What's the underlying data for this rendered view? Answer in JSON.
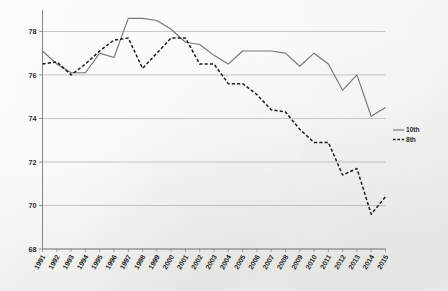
{
  "chart_data": {
    "type": "line",
    "title": "",
    "subtitle": "",
    "xlabel": "",
    "ylabel": "",
    "grid": "horizontal",
    "legend_position": "right-middle",
    "xlim": [
      1991,
      2015
    ],
    "ylim": [
      68,
      78.8
    ],
    "yticks": [
      68,
      70,
      72,
      74,
      76,
      78
    ],
    "ytick_labels": [
      "68",
      "70",
      "72",
      "74",
      "76",
      "78"
    ],
    "categories": [
      "1991",
      "1992",
      "1993",
      "1994",
      "1995",
      "1996",
      "1997",
      "1998",
      "1999",
      "2000",
      "2001",
      "2002",
      "2003",
      "2004",
      "2005",
      "2006",
      "2007",
      "2008",
      "2009",
      "2010",
      "2011",
      "2012",
      "2013",
      "2014",
      "2015"
    ],
    "series": [
      {
        "name": "10th",
        "style": "solid",
        "color": "#767676",
        "values": [
          77.1,
          76.5,
          76.1,
          76.1,
          77.0,
          76.8,
          78.6,
          78.6,
          78.5,
          78.1,
          77.5,
          77.4,
          76.9,
          76.5,
          77.1,
          77.1,
          77.1,
          77.0,
          76.4,
          77.0,
          76.5,
          75.3,
          76.0,
          74.1,
          74.5
        ]
      },
      {
        "name": "8th",
        "style": "dashed",
        "color": "#1c1c1c",
        "values": [
          76.5,
          76.6,
          76.0,
          76.5,
          77.1,
          77.6,
          77.7,
          76.3,
          77.0,
          77.7,
          77.7,
          76.5,
          76.5,
          75.6,
          75.6,
          75.1,
          74.4,
          74.3,
          73.5,
          72.9,
          72.9,
          71.4,
          71.7,
          69.6,
          70.4
        ]
      }
    ],
    "legend": [
      {
        "label": "10th",
        "style": "solid"
      },
      {
        "label": "8th",
        "style": "dashed"
      }
    ],
    "colors": {
      "series_10th": "#767676",
      "series_8th": "#1c1c1c",
      "grid": "#a9a9a9",
      "axis": "#7a7a7a",
      "background": "#f0f0ee",
      "text": "#2b2b2b"
    }
  }
}
